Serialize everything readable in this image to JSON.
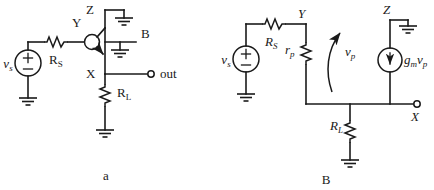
{
  "figure": {
    "caption_a": "a",
    "caption_b": "B",
    "width": 434,
    "height": 190,
    "ink_color": "#1a1a1a",
    "background": "#ffffff"
  },
  "circuit_a": {
    "name": "transistor-level-circuit",
    "caption": "a",
    "source": {
      "label": "v",
      "sub": "s",
      "plus": "+",
      "minus": "–"
    },
    "resistors": [
      {
        "id": "rs",
        "label": "R",
        "sub": "S",
        "orientation": "horizontal"
      },
      {
        "id": "rl",
        "label": "R",
        "sub": "L",
        "orientation": "vertical"
      }
    ],
    "nodes": [
      {
        "id": "y",
        "label": "Y"
      },
      {
        "id": "z",
        "label": "Z"
      },
      {
        "id": "x",
        "label": "X"
      },
      {
        "id": "b",
        "label": "B"
      }
    ],
    "output_terminal": {
      "label": "out"
    },
    "grounds": 4
  },
  "circuit_b": {
    "name": "small-signal-equivalent-circuit",
    "caption": "B",
    "source": {
      "label": "v",
      "sub": "s",
      "plus": "+",
      "minus": "–"
    },
    "resistors": [
      {
        "id": "rs",
        "label": "R",
        "sub": "S",
        "orientation": "horizontal"
      },
      {
        "id": "rp",
        "label": "r",
        "sub": "p",
        "orientation": "vertical"
      },
      {
        "id": "rl",
        "label": "R",
        "sub": "L",
        "orientation": "vertical"
      }
    ],
    "dependent_source": {
      "id": "gmvp",
      "label_gm": "g",
      "label_gm_sub": "m",
      "label_v": "v",
      "label_v_sub": "p",
      "arrow_direction": "down"
    },
    "voltage_arrow": {
      "label": "v",
      "sub": "p",
      "direction": "up",
      "style": "curved"
    },
    "nodes": [
      {
        "id": "y",
        "label": "Y"
      },
      {
        "id": "z",
        "label": "Z"
      },
      {
        "id": "x",
        "label": "X"
      }
    ],
    "grounds": 3
  }
}
